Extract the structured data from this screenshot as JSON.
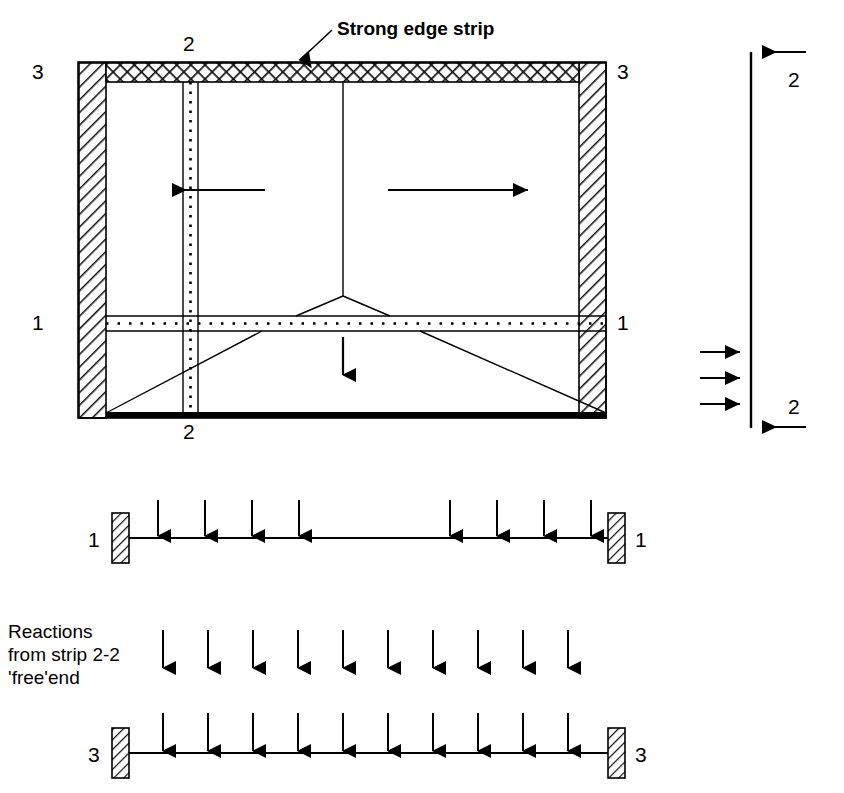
{
  "diagram": {
    "title_callout": "Strong edge strip",
    "reactions_note": "Reactions\nfrom strip 2-2\n'free'end",
    "colors": {
      "ink": "#000000",
      "paper": "#ffffff",
      "hatch": "#1a1a1a"
    },
    "section_marks": {
      "top_strip2": "2",
      "bottom_strip2": "2",
      "left_top3": "3",
      "right_top3": "3",
      "left_mid1": "1",
      "right_mid1": "1",
      "beam11_left": "1",
      "beam11_right": "1",
      "beam33_left": "3",
      "beam33_right": "3",
      "side_top2": "2",
      "side_bottom2": "2"
    },
    "plan": {
      "label": "slab-plan-view",
      "edges": {
        "top": "strong-edge-strip-crosshatch",
        "left": "fixed-support-hatched",
        "right": "fixed-support-hatched",
        "bottom": "free-edge-thick"
      },
      "arrows": {
        "left_horizontal": "points-left",
        "right_horizontal": "points-right",
        "center_vertical": "points-down"
      }
    },
    "strip11": {
      "label": "strip-1-1-load-diagram",
      "arrow_count_left": 4,
      "arrow_count_right": 4,
      "left_positions": [
        158,
        205,
        252,
        299
      ],
      "right_positions": [
        450,
        497,
        544,
        591
      ],
      "support": "hatched-block-both-ends"
    },
    "strip22_side": {
      "label": "strip-2-2-side-elevation",
      "top_arrow": "points-left",
      "bottom_arrow": "points-left",
      "mid_arrows": 3,
      "mid_arrow_direction": "points-right"
    },
    "strip33": {
      "label": "strip-3-3-load-diagram",
      "free_row_arrow_count": 10,
      "beam_row_arrow_count": 10,
      "positions": [
        163,
        208,
        253,
        298,
        343,
        388,
        433,
        478,
        523,
        568
      ],
      "support": "hatched-block-both-ends"
    }
  }
}
